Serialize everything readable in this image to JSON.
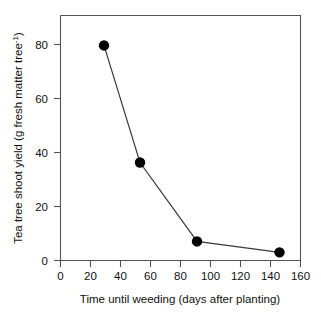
{
  "chart_data": {
    "type": "line",
    "title": "",
    "xlabel": "Time until weeding (days after planting)",
    "ylabel": "Tea tree shoot yield (g fresh matter tree",
    "ylabel_sup": "-1",
    "ylabel_tail": ")",
    "xlim": [
      0,
      160
    ],
    "ylim": [
      0,
      90
    ],
    "grid": false,
    "legend": "none",
    "marker": "filled-circle",
    "x": [
      29,
      53,
      91,
      146
    ],
    "values": [
      79,
      36,
      7,
      3
    ],
    "series": [
      {
        "name": "Tea tree shoot yield",
        "x": [
          29,
          53,
          91,
          146
        ],
        "values": [
          79,
          36,
          7,
          3
        ]
      }
    ],
    "xticks": [
      0,
      20,
      40,
      60,
      80,
      100,
      120,
      140,
      160
    ],
    "xticklabels": [
      "0",
      "20",
      "40",
      "60",
      "80",
      "100",
      "120",
      "140",
      "160"
    ],
    "yticks": [
      0,
      20,
      40,
      60,
      80
    ],
    "yticklabels": [
      "0",
      "20",
      "40",
      "60",
      "80"
    ],
    "line_color": "#3a3a3a",
    "marker_color": "#000000",
    "axis_color": "#555555",
    "background": "#ffffff"
  }
}
